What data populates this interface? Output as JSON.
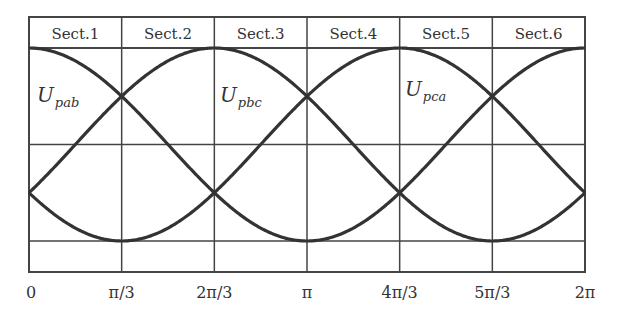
{
  "chart_data": {
    "type": "line",
    "title": "",
    "xlabel": "",
    "ylabel": "",
    "x_range": [
      0,
      6.2832
    ],
    "y_range": [
      -1,
      1
    ],
    "grid": true,
    "sections": [
      "Sect.1",
      "Sect.2",
      "Sect.3",
      "Sect.4",
      "Sect.5",
      "Sect.6"
    ],
    "x_ticks": [
      "0",
      "π/3",
      "2π/3",
      "π",
      "4π/3",
      "5π/3",
      "2π"
    ],
    "x_tick_values": [
      0,
      1.0472,
      2.0944,
      3.1416,
      4.1888,
      5.236,
      6.2832
    ],
    "series": [
      {
        "name": "U_pab",
        "function": "cos(θ)",
        "phase_deg": 0,
        "label_base": "U",
        "label_sub": "pab"
      },
      {
        "name": "U_pbc",
        "function": "cos(θ - 2π/3)",
        "phase_deg": -120,
        "label_base": "U",
        "label_sub": "pbc"
      },
      {
        "name": "U_pca",
        "function": "cos(θ + 2π/3)",
        "phase_deg": 120,
        "label_base": "U",
        "label_sub": "pca"
      }
    ],
    "crossings": {
      "upper_value": 0.5,
      "upper_at": [
        "π/3",
        "π",
        "5π/3"
      ],
      "lower_value": -0.5,
      "lower_at": [
        "0",
        "2π/3",
        "4π/3",
        "2π"
      ]
    },
    "colors": {
      "line": "#333333",
      "grid": "#444444",
      "background": "#ffffff"
    }
  }
}
